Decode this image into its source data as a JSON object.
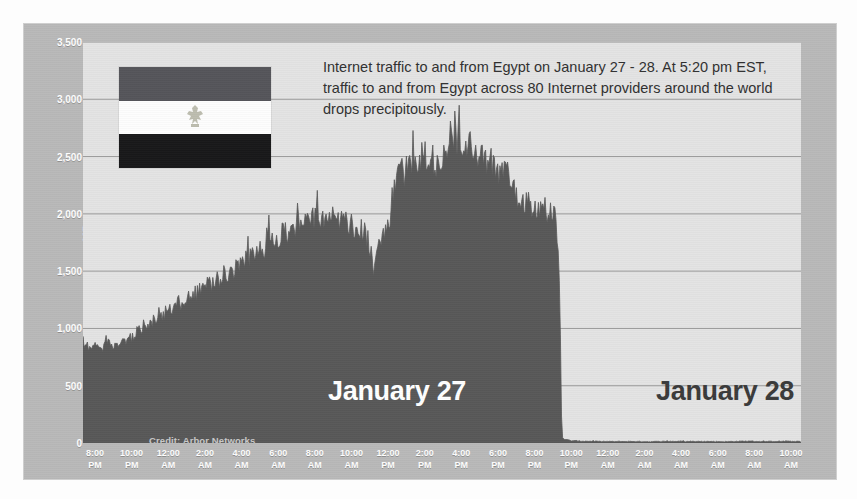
{
  "figure": {
    "credit": "Credit: Arbor Networks",
    "annotation": "Internet traffic to and from Egypt on January 27 - 28. At 5:20 pm EST, traffic to and from Egypt across 80 Internet providers around the world  drops precipitously.",
    "day_label_left": "January 27",
    "day_label_right": "January 28",
    "flag_alt": "egypt-flag"
  },
  "colors": {
    "frame_background": "#b9b9b9",
    "plot_background": "#e3e3e3",
    "series_fill": "#585858",
    "gridline": "#9a9a9a",
    "axis_text": "#ffffff",
    "annotation_text": "#303030",
    "day_label_left_color": "#ffffff",
    "day_label_right_color": "#3a3a3a",
    "flag_top": "#55555a",
    "flag_middle": "#fdfdfd",
    "flag_bottom": "#18181a"
  },
  "chart_data": {
    "type": "area",
    "title": "",
    "subtitle": "",
    "xlabel": "",
    "ylabel": "MBps",
    "ylim": [
      0,
      3500
    ],
    "yticks": [
      0,
      500,
      1000,
      1500,
      2000,
      2500,
      3000,
      3500
    ],
    "ytick_labels": [
      "0",
      "500",
      "1,000",
      "1,500",
      "2,000",
      "2,500",
      "3,000",
      "3,500"
    ],
    "grid": true,
    "legend": null,
    "xtick_labels": [
      {
        "time": "8:00",
        "meridiem": "PM"
      },
      {
        "time": "10:00",
        "meridiem": "PM"
      },
      {
        "time": "12:00",
        "meridiem": "AM"
      },
      {
        "time": "2:00",
        "meridiem": "AM"
      },
      {
        "time": "4:00",
        "meridiem": "AM"
      },
      {
        "time": "6:00",
        "meridiem": "AM"
      },
      {
        "time": "8:00",
        "meridiem": "AM"
      },
      {
        "time": "10:00",
        "meridiem": "AM"
      },
      {
        "time": "12:00",
        "meridiem": "PM"
      },
      {
        "time": "2:00",
        "meridiem": "PM"
      },
      {
        "time": "4:00",
        "meridiem": "PM"
      },
      {
        "time": "6:00",
        "meridiem": "PM"
      },
      {
        "time": "8:00",
        "meridiem": "PM"
      },
      {
        "time": "10:00",
        "meridiem": "PM"
      },
      {
        "time": "12:00",
        "meridiem": "AM"
      },
      {
        "time": "2:00",
        "meridiem": "AM"
      },
      {
        "time": "4:00",
        "meridiem": "AM"
      },
      {
        "time": "6:00",
        "meridiem": "AM"
      },
      {
        "time": "8:00",
        "meridiem": "AM"
      },
      {
        "time": "10:00",
        "meridiem": "AM"
      }
    ],
    "xlim_hours": [
      20,
      58
    ],
    "series": [
      {
        "name": "Egypt Internet traffic",
        "unit": "MBps",
        "x_hours": [
          20.0,
          20.2,
          20.4,
          20.6,
          20.8,
          21.0,
          21.2,
          21.4,
          21.6,
          21.8,
          22.0,
          22.2,
          22.4,
          22.6,
          22.8,
          23.0,
          23.2,
          23.4,
          23.6,
          23.8,
          24.0,
          24.2,
          24.4,
          24.6,
          24.8,
          25.0,
          25.2,
          25.4,
          25.6,
          25.8,
          26.0,
          26.2,
          26.4,
          26.6,
          26.8,
          27.0,
          27.2,
          27.4,
          27.6,
          27.8,
          28.0,
          28.2,
          28.4,
          28.6,
          28.8,
          29.0,
          29.2,
          29.4,
          29.6,
          29.8,
          30.0,
          30.2,
          30.4,
          30.6,
          30.8,
          31.0,
          31.2,
          31.4,
          31.6,
          31.8,
          32.0,
          32.2,
          32.4,
          32.6,
          32.8,
          33.0,
          33.2,
          33.4,
          33.6,
          33.8,
          34.0,
          34.2,
          34.4,
          34.6,
          34.8,
          35.0,
          35.2,
          35.4,
          35.6,
          35.8,
          36.0,
          36.2,
          36.4,
          36.6,
          36.8,
          37.0,
          37.2,
          37.4,
          37.6,
          37.8,
          38.0,
          38.2,
          38.4,
          38.6,
          38.8,
          39.0,
          39.2,
          39.4,
          39.6,
          39.8,
          40.0,
          40.2,
          40.4,
          40.6,
          40.8,
          41.0,
          41.2,
          41.4,
          41.6,
          41.8,
          42.0,
          42.2,
          42.4,
          42.6,
          42.8,
          43.0,
          43.2,
          43.4,
          43.6,
          43.8,
          44.0,
          44.2,
          44.4,
          44.6,
          44.8,
          45.0,
          45.2,
          45.3,
          45.33,
          45.4,
          45.6,
          45.8,
          46.0,
          46.5,
          47.0,
          48.0,
          49.0,
          50.0,
          51.0,
          52.0,
          53.0,
          54.0,
          55.0,
          56.0,
          57.0,
          58.0
        ],
        "y_mbps": [
          880,
          840,
          800,
          860,
          830,
          790,
          900,
          860,
          820,
          870,
          900,
          880,
          930,
          900,
          950,
          1000,
          980,
          1040,
          1010,
          1080,
          1120,
          1090,
          1150,
          1190,
          1160,
          1230,
          1210,
          1270,
          1250,
          1300,
          1290,
          1340,
          1320,
          1380,
          1360,
          1420,
          1400,
          1460,
          1450,
          1520,
          1500,
          1560,
          1540,
          1600,
          1590,
          1650,
          1630,
          1700,
          1680,
          1740,
          1720,
          1790,
          1770,
          1830,
          1810,
          1870,
          1850,
          1900,
          1880,
          1940,
          1910,
          1950,
          1930,
          1960,
          1940,
          1970,
          1950,
          1930,
          1900,
          1950,
          1920,
          1890,
          1860,
          1880,
          1840,
          1800,
          1700,
          1450,
          1680,
          1790,
          1830,
          1880,
          2150,
          2250,
          2330,
          2300,
          2400,
          2380,
          2450,
          2420,
          2500,
          2470,
          2380,
          2420,
          2350,
          2450,
          2520,
          2600,
          2610,
          2600,
          2590,
          2600,
          2580,
          2560,
          2500,
          2480,
          2450,
          2400,
          2430,
          2380,
          2350,
          2400,
          2330,
          2280,
          2200,
          2150,
          2120,
          2100,
          2080,
          2060,
          2050,
          2040,
          2030,
          2010,
          1990,
          1950,
          1500,
          700,
          120,
          40,
          25,
          20,
          18,
          15,
          14,
          12,
          13,
          11,
          14,
          12,
          13,
          11,
          15,
          12,
          14,
          13
        ]
      }
    ],
    "annotations": [
      {
        "name": "shutdown-event",
        "label": "traffic drops precipitously",
        "at_hour": 45.33,
        "value_mbps": 120
      }
    ]
  }
}
